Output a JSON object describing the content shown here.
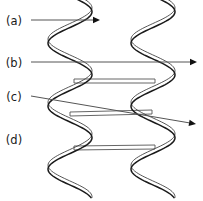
{
  "figure": {
    "background_color": "#ffffff",
    "width": 203,
    "height": 201,
    "stroke_color": "#1a1a1a",
    "leader_color": "#555555"
  },
  "labels": [
    {
      "id": "a",
      "text": "(a)",
      "x": 14,
      "y": 21,
      "has_leader": true
    },
    {
      "id": "b",
      "text": "(b)",
      "x": 14,
      "y": 63,
      "has_leader": true
    },
    {
      "id": "c",
      "text": "(c)",
      "x": 14,
      "y": 97,
      "has_leader": true
    },
    {
      "id": "d",
      "text": "(d)",
      "x": 14,
      "y": 140,
      "has_leader": false
    }
  ],
  "leaders": [
    {
      "id": "leader-a",
      "from_x": 31,
      "from_y": 20,
      "to_x": 100,
      "to_y": 20
    },
    {
      "id": "leader-b",
      "from_x": 31,
      "from_y": 62,
      "to_x": 197,
      "to_y": 62
    },
    {
      "id": "leader-c",
      "from_x": 31,
      "from_y": 96,
      "to_x": 196,
      "to_y": 124
    }
  ],
  "helices": [
    {
      "id": "helix-left",
      "center_x": 70,
      "amplitude": 22,
      "period": 63,
      "phase": 0,
      "top": -4,
      "bottom": 198,
      "strand_offset": 5
    },
    {
      "id": "helix-right",
      "center_x": 153,
      "amplitude": 22,
      "period": 63,
      "phase": 0,
      "top": -4,
      "bottom": 198,
      "strand_offset": 5
    }
  ],
  "rungs": [
    {
      "id": "rung-1",
      "y_left": 79,
      "y_right": 79,
      "x_left": 74,
      "x_right": 155,
      "thickness": 4
    },
    {
      "id": "rung-2",
      "y_left": 112,
      "y_right": 110,
      "x_left": 70,
      "x_right": 152,
      "thickness": 4
    },
    {
      "id": "rung-3",
      "y_left": 146,
      "y_right": 145,
      "x_left": 74,
      "x_right": 155,
      "thickness": 4
    }
  ]
}
